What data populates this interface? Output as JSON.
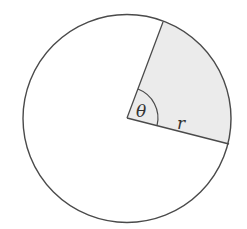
{
  "diagram": {
    "type": "circle-sector",
    "labels": {
      "angle": "θ",
      "radius": "r"
    },
    "colors": {
      "stroke": "#4a4a4a",
      "sector_fill": "#ebebeb",
      "background": "#ffffff"
    }
  }
}
